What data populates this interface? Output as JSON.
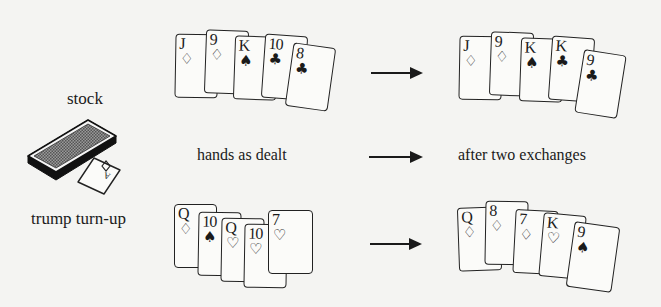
{
  "labels": {
    "stock": "stock",
    "trump_turnup": "trump turn-up",
    "hands_as_dealt": "hands as dealt",
    "after_two_exchanges": "after two exchanges"
  },
  "trump_card": {
    "rank": "A",
    "suit": "♢"
  },
  "hands": {
    "top_dealt": [
      {
        "rank": "J",
        "suit": "♢"
      },
      {
        "rank": "9",
        "suit": "♢"
      },
      {
        "rank": "K",
        "suit": "♠"
      },
      {
        "rank": "10",
        "suit": "♣"
      },
      {
        "rank": "8",
        "suit": "♣"
      }
    ],
    "top_after": [
      {
        "rank": "J",
        "suit": "♢"
      },
      {
        "rank": "9",
        "suit": "♢"
      },
      {
        "rank": "K",
        "suit": "♠"
      },
      {
        "rank": "K",
        "suit": "♣"
      },
      {
        "rank": "9",
        "suit": "♣"
      }
    ],
    "bottom_dealt": [
      {
        "rank": "Q",
        "suit": "♢"
      },
      {
        "rank": "10",
        "suit": "♠"
      },
      {
        "rank": "Q",
        "suit": "♡"
      },
      {
        "rank": "10",
        "suit": "♡"
      },
      {
        "rank": "7",
        "suit": "♡"
      }
    ],
    "bottom_after": [
      {
        "rank": "Q",
        "suit": "♢"
      },
      {
        "rank": "8",
        "suit": "♢"
      },
      {
        "rank": "7",
        "suit": "♢"
      },
      {
        "rank": "K",
        "suit": "♡"
      },
      {
        "rank": "9",
        "suit": "♠"
      }
    ]
  }
}
